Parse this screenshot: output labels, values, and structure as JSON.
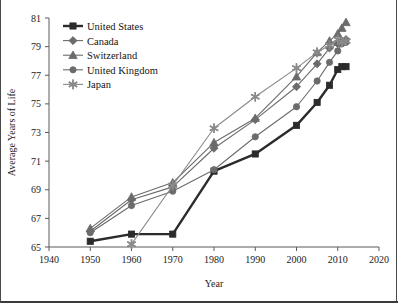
{
  "chart_data": {
    "type": "line",
    "title": "",
    "xlabel": "Year",
    "ylabel": "Average Years of Life",
    "xlim": [
      1940,
      2020
    ],
    "ylim": [
      65,
      81
    ],
    "xticks": [
      1940,
      1950,
      1960,
      1970,
      1980,
      1990,
      2000,
      2010,
      2020
    ],
    "yticks": [
      65,
      67,
      69,
      71,
      73,
      75,
      77,
      79,
      81
    ],
    "grid": false,
    "legend_position": "top-left",
    "series": [
      {
        "name": "United States",
        "marker": "square",
        "color": "#2b2b2b",
        "linewidth": 2.4,
        "x": [
          1950,
          1960,
          1970,
          1980,
          1990,
          2000,
          2005,
          2008,
          2010,
          2011,
          2012
        ],
        "values": [
          65.4,
          65.9,
          65.9,
          70.3,
          71.5,
          73.5,
          75.1,
          76.3,
          77.4,
          77.6,
          77.6
        ]
      },
      {
        "name": "Canada",
        "marker": "diamond",
        "color": "#6b6b6b",
        "linewidth": 1.1,
        "x": [
          1950,
          1960,
          1970,
          1980,
          1990,
          2000,
          2005,
          2008,
          2010,
          2011,
          2012
        ],
        "values": [
          66.1,
          68.3,
          69.2,
          71.9,
          73.9,
          76.2,
          77.8,
          78.9,
          79.2,
          79.4,
          79.5
        ]
      },
      {
        "name": "Switzerland",
        "marker": "triangle",
        "color": "#6b6b6b",
        "linewidth": 1.1,
        "x": [
          1950,
          1960,
          1970,
          1980,
          1990,
          2000,
          2005,
          2008,
          2010,
          2011,
          2012
        ],
        "values": [
          66.3,
          68.5,
          69.5,
          72.3,
          74.0,
          76.9,
          78.6,
          79.4,
          79.9,
          80.3,
          80.7
        ]
      },
      {
        "name": "United Kingdom",
        "marker": "circle",
        "color": "#6b6b6b",
        "linewidth": 1.1,
        "x": [
          1950,
          1960,
          1970,
          1980,
          1990,
          2000,
          2005,
          2008,
          2010,
          2011,
          2012
        ],
        "values": [
          66.0,
          67.9,
          68.9,
          70.4,
          72.7,
          74.8,
          76.6,
          77.9,
          78.7,
          79.2,
          79.3
        ]
      },
      {
        "name": "Japan",
        "marker": "star",
        "color": "#8a8a8a",
        "linewidth": 1.1,
        "x": [
          1960,
          1970,
          1980,
          1990,
          2000,
          2005,
          2008,
          2010,
          2011,
          2012
        ],
        "values": [
          65.2,
          69.3,
          73.3,
          75.5,
          77.5,
          78.6,
          79.1,
          79.5,
          79.3,
          79.4
        ]
      }
    ]
  },
  "legend": {
    "entries": [
      {
        "label": "United States"
      },
      {
        "label": "Canada"
      },
      {
        "label": "Switzerland"
      },
      {
        "label": "United Kingdom"
      },
      {
        "label": "Japan"
      }
    ]
  },
  "axes": {
    "y_title": "Average Years of Life",
    "x_title": "Year",
    "y_tick_labels": [
      "65",
      "67",
      "69",
      "71",
      "73",
      "75",
      "77",
      "79",
      "81"
    ],
    "x_tick_labels": [
      "1940",
      "1950",
      "1960",
      "1970",
      "1980",
      "1990",
      "2000",
      "2010",
      "2020"
    ]
  },
  "colors": {
    "axis": "#5a5a5a",
    "text": "#1b1b1b",
    "frame": "#4a4a4a",
    "primary_series": "#2b2b2b",
    "secondary_series": "#6b6b6b",
    "japan_series": "#8a8a8a"
  }
}
